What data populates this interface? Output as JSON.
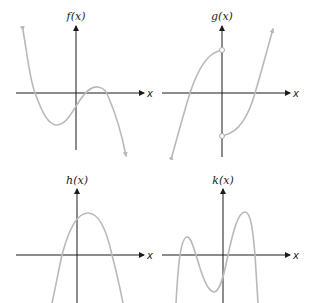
{
  "figure": {
    "panels": [
      {
        "id": "f",
        "title": "f(x)",
        "x_axis_label": "x",
        "description": "Cubic with negative leading coefficient: rises from upper left, local minimum below x-axis left of origin, crosses y-axis below origin, local maximum above x-axis right of origin, falls to lower right.",
        "discontinuities": []
      },
      {
        "id": "g",
        "title": "g(x)",
        "x_axis_label": "x",
        "description": "Piecewise function with jump discontinuity at x=0: left branch rises from lower left to an open circle on positive y-axis; right branch starts at an open circle on negative y-axis and rises to upper right.",
        "discontinuities": [
          {
            "x": 0,
            "type": "jump",
            "left_limit": "positive (open circle)",
            "right_limit": "negative (open circle)"
          }
        ]
      },
      {
        "id": "h",
        "title": "h(x)",
        "x_axis_label": "x",
        "description": "Downward-opening parabola with vertex slightly right of y-axis above x-axis; two x-intercepts, one on each side of origin.",
        "discontinuities": []
      },
      {
        "id": "k",
        "title": "k(x)",
        "x_axis_label": "x",
        "description": "Quartic with negative leading coefficient: two local maxima (smaller left, taller right) and one local minimum just left of y-axis below x-axis; four x-intercepts; both ends go down.",
        "discontinuities": []
      }
    ],
    "colors": {
      "axis": "#1a1a1a",
      "curve": "#b9b9b9",
      "background": "#ffffff"
    }
  }
}
